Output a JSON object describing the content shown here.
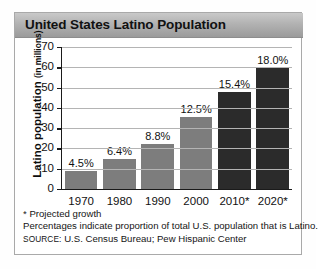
{
  "title": "United States Latino Population",
  "axis": {
    "y_label_main": "Latino population",
    "y_label_unit": "(in millions)",
    "y_ticks": [
      "0",
      "10",
      "20",
      "30",
      "40",
      "50",
      "60",
      "70"
    ]
  },
  "footnotes": {
    "projected": "* Projected growth",
    "percent_note": "Percentages indicate proportion of total U.S. population that is Latino.",
    "source_word": "SOURCE:",
    "source_text": " U.S. Census Bureau; Pew Hispanic Center"
  },
  "colors": {
    "bar_actual": "#7d7d7d",
    "bar_projected": "#2b2b2b",
    "title_bar": "#b2b2b2",
    "axis": "#1a1a1a",
    "gridline": "#b4b4b4"
  },
  "chart_data": {
    "type": "bar",
    "title": "United States Latino Population",
    "xlabel": "",
    "ylabel": "Latino population (in millions)",
    "ylim": [
      0,
      70
    ],
    "yticks": [
      0,
      10,
      20,
      30,
      40,
      50,
      60,
      70
    ],
    "grid": true,
    "legend": "none",
    "categories": [
      "1970",
      "1980",
      "1990",
      "2000",
      "2010*",
      "2020*"
    ],
    "values": [
      9.1,
      14.6,
      22.4,
      35.3,
      47.8,
      59.8
    ],
    "data_labels": [
      "4.5%",
      "6.4%",
      "8.8%",
      "12.5%",
      "15.4%",
      "18.0%"
    ],
    "series": [
      {
        "name": "Latino population (in millions)",
        "values": [
          9.1,
          14.6,
          22.4,
          35.3,
          47.8,
          59.8
        ]
      }
    ],
    "annotations": [
      "* Projected growth",
      "Percentages indicate proportion of total U.S. population that is Latino.",
      "SOURCE: U.S. Census Bureau; Pew Hispanic Center"
    ]
  }
}
